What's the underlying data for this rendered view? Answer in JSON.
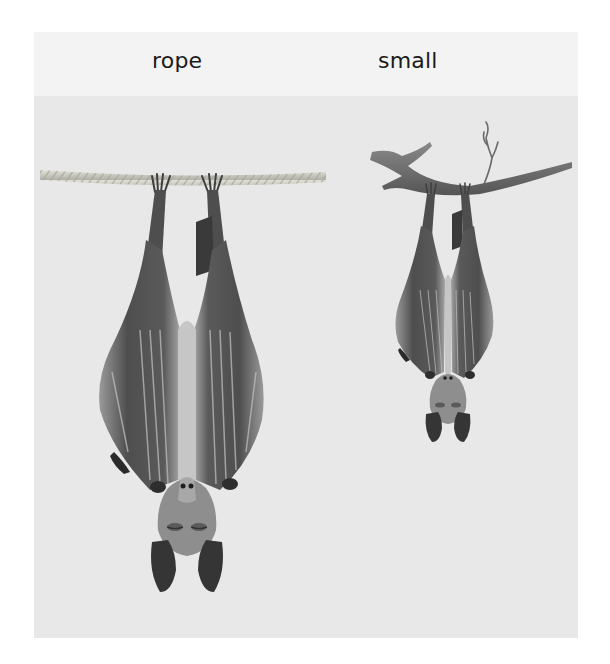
{
  "figure": {
    "labels": {
      "left": "rope",
      "right": "small"
    },
    "panels": [
      {
        "name": "left",
        "label": "rope",
        "support": "rope",
        "subject": "hanging-bat-large"
      },
      {
        "name": "right",
        "label": "small",
        "support": "branch",
        "subject": "hanging-bat-small"
      }
    ],
    "colors": {
      "background": "#e8e8e8",
      "header": "#f3f3f3",
      "text": "#1a1a1a",
      "rope": "#cfcfc6",
      "branch": "#6e6e6e",
      "bat_dark": "#4a4a4a",
      "bat_mid": "#8a8a8a",
      "bat_light": "#c9c9c9"
    }
  }
}
